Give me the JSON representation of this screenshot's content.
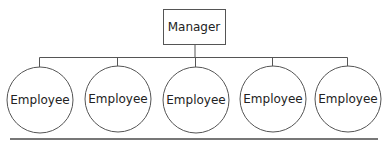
{
  "diagram": {
    "type": "org-chart",
    "manager": {
      "label": "Manager"
    },
    "employees": [
      {
        "label": "Employee"
      },
      {
        "label": "Employee"
      },
      {
        "label": "Employee"
      },
      {
        "label": "Employee"
      },
      {
        "label": "Employee"
      }
    ],
    "colors": {
      "stroke": "#555555",
      "text": "#222222",
      "rule": "#777777",
      "background": "#ffffff"
    }
  }
}
